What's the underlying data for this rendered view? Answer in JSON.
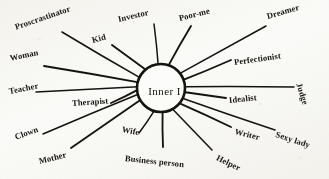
{
  "diagram": {
    "title": "Inner I",
    "type": "radial-spoke-diagram",
    "hub": {
      "label": "Inner I",
      "center_x": 161,
      "center_y": 88,
      "radius": 24
    },
    "ink_color": "#15130f",
    "background_color": "#fbfbf9",
    "spoke_count": 18,
    "nodes": [
      {
        "id": "proscrastinator",
        "label": "Proscrastinator",
        "angle_deg": 206,
        "label_x": 15,
        "label_y": 22,
        "rotation_deg": -19,
        "font_size": 8.5,
        "spoke_outer_x": 62,
        "spoke_outer_y": 32
      },
      {
        "id": "kid",
        "label": "Kid",
        "angle_deg": 231,
        "label_x": 92,
        "label_y": 35,
        "rotation_deg": -15,
        "font_size": 8.5,
        "spoke_outer_x": 112,
        "spoke_outer_y": 45
      },
      {
        "id": "investor",
        "label": "Investor",
        "angle_deg": 263,
        "label_x": 118,
        "label_y": 14,
        "rotation_deg": -13,
        "font_size": 8.5,
        "spoke_outer_x": 154,
        "spoke_outer_y": 24
      },
      {
        "id": "poor-me",
        "label": "Poor-me",
        "angle_deg": 288,
        "label_x": 179,
        "label_y": 13,
        "rotation_deg": -14,
        "font_size": 8.5,
        "spoke_outer_x": 191,
        "spoke_outer_y": 26
      },
      {
        "id": "dreamer",
        "label": "Dreamer",
        "angle_deg": 322,
        "label_x": 267,
        "label_y": 11,
        "rotation_deg": -16,
        "font_size": 8.5,
        "spoke_outer_x": 266,
        "spoke_outer_y": 26
      },
      {
        "id": "perfectionist",
        "label": "Perfectionist",
        "angle_deg": 340,
        "label_x": 234,
        "label_y": 57,
        "rotation_deg": -8,
        "font_size": 8.5,
        "spoke_outer_x": 231,
        "spoke_outer_y": 60
      },
      {
        "id": "judge",
        "label": "Judge",
        "angle_deg": 357,
        "label_x": 299,
        "label_y": 78,
        "rotation_deg": 72,
        "font_size": 8.5,
        "spoke_outer_x": 294,
        "spoke_outer_y": 87
      },
      {
        "id": "idealist",
        "label": "Idealist",
        "angle_deg": 10,
        "label_x": 229,
        "label_y": 95,
        "rotation_deg": -6,
        "font_size": 8.5,
        "spoke_outer_x": 226,
        "spoke_outer_y": 98
      },
      {
        "id": "sexy-lady",
        "label": "Sexy lady",
        "angle_deg": 26,
        "label_x": 276,
        "label_y": 129,
        "rotation_deg": 18,
        "font_size": 8.5,
        "spoke_outer_x": 275,
        "spoke_outer_y": 130
      },
      {
        "id": "writer",
        "label": "Writer",
        "angle_deg": 40,
        "label_x": 235,
        "label_y": 126,
        "rotation_deg": 14,
        "font_size": 8.5,
        "spoke_outer_x": 231,
        "spoke_outer_y": 127
      },
      {
        "id": "helper",
        "label": "Helper",
        "angle_deg": 62,
        "label_x": 217,
        "label_y": 152,
        "rotation_deg": 26,
        "font_size": 8.5,
        "spoke_outer_x": 212,
        "spoke_outer_y": 150
      },
      {
        "id": "business-person",
        "label": "Business person",
        "angle_deg": 86,
        "label_x": 125,
        "label_y": 153,
        "rotation_deg": 6,
        "font_size": 8.5,
        "spoke_outer_x": 163,
        "spoke_outer_y": 147
      },
      {
        "id": "wife",
        "label": "Wife",
        "angle_deg": 106,
        "label_x": 122,
        "label_y": 124,
        "rotation_deg": 11,
        "font_size": 8.5,
        "spoke_outer_x": 139,
        "spoke_outer_y": 133
      },
      {
        "id": "mother",
        "label": "Mother",
        "angle_deg": 150,
        "label_x": 39,
        "label_y": 156,
        "rotation_deg": -14,
        "font_size": 8.5,
        "spoke_outer_x": 71,
        "spoke_outer_y": 148
      },
      {
        "id": "clown",
        "label": "Clown",
        "angle_deg": 165,
        "label_x": 15,
        "label_y": 132,
        "rotation_deg": -20,
        "font_size": 8.5,
        "spoke_outer_x": 43,
        "spoke_outer_y": 134
      },
      {
        "id": "therapist",
        "label": "Therapist",
        "angle_deg": 176,
        "label_x": 72,
        "label_y": 98,
        "rotation_deg": -4,
        "font_size": 8.5,
        "spoke_outer_x": 111,
        "spoke_outer_y": 103
      },
      {
        "id": "teacher",
        "label": "Teacher",
        "angle_deg": 183,
        "label_x": 9,
        "label_y": 86,
        "rotation_deg": -11,
        "font_size": 8.5,
        "spoke_outer_x": 36,
        "spoke_outer_y": 92
      },
      {
        "id": "woman",
        "label": "Woman",
        "angle_deg": 194,
        "label_x": 10,
        "label_y": 53,
        "rotation_deg": -12,
        "font_size": 8.5,
        "spoke_outer_x": 44,
        "spoke_outer_y": 66
      }
    ]
  }
}
